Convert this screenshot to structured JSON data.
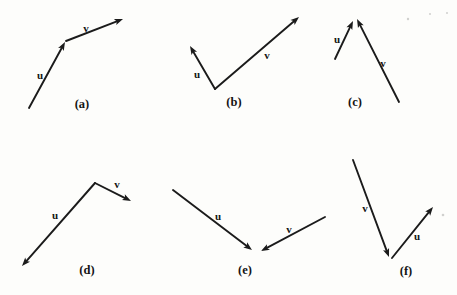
{
  "figure": {
    "width": 457,
    "height": 295,
    "background_color": "#fdfdfb",
    "line_color": "#1b1b1b",
    "label_color": "#141414",
    "stroke_width": 1.9,
    "arrowhead": {
      "length": 8.5,
      "half_width": 3.2,
      "notch": 6.6
    },
    "panels": [
      {
        "caption": "(a)",
        "caption_xy": [
          82,
          104
        ],
        "vectors": [
          {
            "label": "u",
            "label_xy": [
              40,
              75
            ],
            "from": [
              29,
              108
            ],
            "to": [
              65,
              42
            ]
          },
          {
            "label": "v",
            "label_xy": [
              86,
              28
            ],
            "from": [
              66,
              41
            ],
            "to": [
              123,
              19
            ]
          }
        ]
      },
      {
        "caption": "(b)",
        "caption_xy": [
          234,
          102
        ],
        "vectors": [
          {
            "label": "u",
            "label_xy": [
              197,
              74
            ],
            "from": [
              215,
              89
            ],
            "to": [
              190,
              46
            ]
          },
          {
            "label": "v",
            "label_xy": [
              267,
              55
            ],
            "from": [
              215,
              89
            ],
            "to": [
              299,
              17
            ]
          }
        ]
      },
      {
        "caption": "(c)",
        "caption_xy": [
          355,
          102
        ],
        "vectors": [
          {
            "label": "u",
            "label_xy": [
              337,
              39
            ],
            "from": [
              335,
              59
            ],
            "to": [
              353,
              21
            ]
          },
          {
            "label": "v",
            "label_xy": [
              383,
              63
            ],
            "from": [
              399,
              102
            ],
            "to": [
              357,
              19
            ]
          }
        ]
      },
      {
        "caption": "(d)",
        "caption_xy": [
          87,
          270
        ],
        "vectors": [
          {
            "label": "u",
            "label_xy": [
              55,
              215
            ],
            "from": [
              95,
              183
            ],
            "to": [
              22,
              266
            ]
          },
          {
            "label": "v",
            "label_xy": [
              117,
              184
            ],
            "from": [
              95,
              183
            ],
            "to": [
              131,
              201
            ]
          }
        ]
      },
      {
        "caption": "(e)",
        "caption_xy": [
          245,
          270
        ],
        "vectors": [
          {
            "label": "u",
            "label_xy": [
              218,
              216
            ],
            "from": [
              173,
              190
            ],
            "to": [
              252,
              250
            ]
          },
          {
            "label": "v",
            "label_xy": [
              289,
              229
            ],
            "from": [
              325,
              217
            ],
            "to": [
              261,
              251
            ]
          }
        ]
      },
      {
        "caption": "(f)",
        "caption_xy": [
          406,
          271
        ],
        "vectors": [
          {
            "label": "v",
            "label_xy": [
              365,
              208
            ],
            "from": [
              353,
              160
            ],
            "to": [
              389,
              257
            ]
          },
          {
            "label": "u",
            "label_xy": [
              417,
              236
            ],
            "from": [
              392,
              258
            ],
            "to": [
              433,
              207
            ]
          }
        ]
      }
    ],
    "specks": [
      {
        "xy": [
          408,
          19
        ],
        "r": 1.2
      },
      {
        "xy": [
          430,
          14
        ],
        "r": 1.0
      },
      {
        "xy": [
          447,
          13
        ],
        "r": 1.0
      },
      {
        "xy": [
          443,
          215
        ],
        "r": 1.3
      }
    ]
  }
}
